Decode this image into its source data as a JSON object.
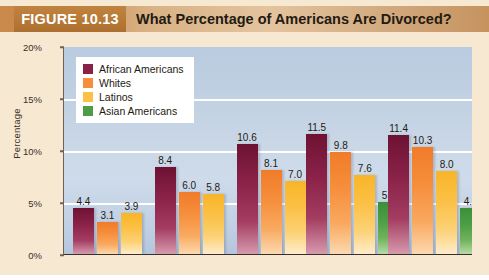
{
  "figure": {
    "badge": "FIGURE 10.13",
    "title": "What Percentage of Americans Are Divorced?"
  },
  "axes": {
    "ylabel": "Percentage",
    "yticks": [
      "0%",
      "5%",
      "10%",
      "15%",
      "20%"
    ],
    "xticks": [
      "1970",
      "1980",
      "1990",
      "2000",
      "2010"
    ]
  },
  "legend": {
    "items": [
      {
        "label": "African Americans",
        "color": "#8a2248",
        "key": "african"
      },
      {
        "label": "Whites",
        "color": "#f68e3c",
        "key": "white"
      },
      {
        "label": "Latinos",
        "color": "#fbc044",
        "key": "latino"
      },
      {
        "label": "Asian Americans",
        "color": "#4c9d45",
        "key": "asian"
      }
    ]
  },
  "chart_data": {
    "type": "bar",
    "title": "What Percentage of Americans Are Divorced?",
    "xlabel": "",
    "ylabel": "Percentage",
    "ylim": [
      0,
      20
    ],
    "ytick_step": 5,
    "grid": true,
    "legend_position": "top-left-inside",
    "categories": [
      "1970",
      "1980",
      "1990",
      "2000",
      "2010"
    ],
    "series": [
      {
        "name": "African Americans",
        "color": "#8a2248",
        "values": [
          4.4,
          8.4,
          10.6,
          11.5,
          11.4
        ]
      },
      {
        "name": "Whites",
        "color": "#f68e3c",
        "values": [
          3.1,
          6.0,
          8.1,
          9.8,
          10.3
        ]
      },
      {
        "name": "Latinos",
        "color": "#fbc044",
        "values": [
          3.9,
          5.8,
          7.0,
          7.6,
          8.0
        ]
      },
      {
        "name": "Asian Americans",
        "color": "#4c9d45",
        "values": [
          null,
          null,
          null,
          5.0,
          4.4
        ]
      }
    ],
    "value_labels": [
      [
        "4.4",
        "3.1",
        "3.9"
      ],
      [
        "8.4",
        "6.0",
        "5.8"
      ],
      [
        "10.6",
        "8.1",
        "7.0"
      ],
      [
        "11.5",
        "9.8",
        "7.6",
        "5.0"
      ],
      [
        "11.4",
        "10.3",
        "8.0",
        "4.4"
      ]
    ]
  }
}
